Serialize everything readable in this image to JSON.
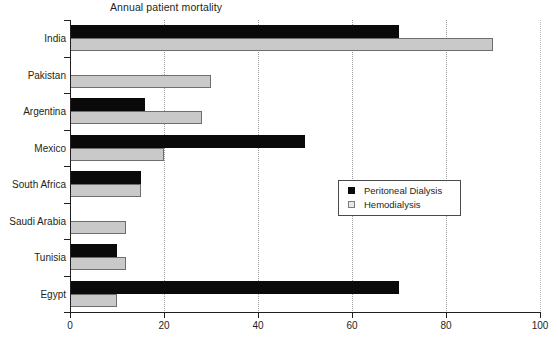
{
  "chart_data": {
    "type": "bar",
    "orientation": "horizontal",
    "title": "Annual patient mortality",
    "xlabel": "",
    "ylabel": "",
    "xlim": [
      0,
      100
    ],
    "xticks": [
      0,
      20,
      40,
      60,
      80,
      100
    ],
    "grid": "vertical-dotted",
    "legend_position": "center-right",
    "categories": [
      "India",
      "Pakistan",
      "Argentina",
      "Mexico",
      "South Africa",
      "Saudi Arabia",
      "Tunisia",
      "Egypt"
    ],
    "series": [
      {
        "name": "Peritoneal Dialysis",
        "color": "#0a0a0a",
        "values": [
          70,
          0,
          16,
          50,
          15,
          0,
          10,
          70
        ]
      },
      {
        "name": "Hemodialysis",
        "color": "#c9c9c9",
        "values": [
          90,
          30,
          28,
          20,
          15,
          12,
          12,
          10
        ]
      }
    ]
  },
  "legend": {
    "items": [
      {
        "label": "Peritoneal Dialysis",
        "swatch": "pd"
      },
      {
        "label": "Hemodialysis",
        "swatch": "hd"
      }
    ]
  },
  "axis": {
    "x_tick_labels": [
      "0",
      "20",
      "40",
      "60",
      "80",
      "100"
    ]
  }
}
